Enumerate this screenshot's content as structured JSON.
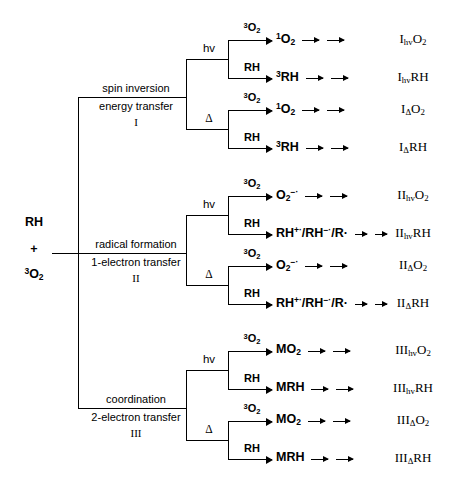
{
  "diagram": {
    "root": {
      "line1": "RH",
      "line2": "+",
      "line3_pre": "3",
      "line3_main": "O",
      "line3_sub": "2"
    },
    "conditions": {
      "photochemical": "hv",
      "thermal": "Δ"
    },
    "reagents": {
      "oxygen_pre": "3",
      "oxygen_main": "O",
      "oxygen_sub": "2",
      "substrate": "RH"
    },
    "branches": [
      {
        "id": "I",
        "name_line1": "spin inversion",
        "name_line2": "energy transfer",
        "numeral": "I",
        "rows": [
          {
            "condition": "hv",
            "reagent": "3O2",
            "species_html": "<sup class='pre'>1</sup>O<sub>2</sub>",
            "product_html": "I<sub>hv</sub>O<sub>2</sub>"
          },
          {
            "condition": "hv",
            "reagent": "RH",
            "species_html": "<sup class='pre'>3</sup>RH",
            "product_html": "I<sub>hv</sub>RH"
          },
          {
            "condition": "Δ",
            "reagent": "3O2",
            "species_html": "<sup class='pre'>1</sup>O<sub>2</sub>",
            "product_html": "I<sub>Δ</sub>O<sub>2</sub>"
          },
          {
            "condition": "Δ",
            "reagent": "RH",
            "species_html": "<sup class='pre'>3</sup>RH",
            "product_html": "I<sub>Δ</sub>RH"
          }
        ]
      },
      {
        "id": "II",
        "name_line1": "radical formation",
        "name_line2": "1-electron transfer",
        "numeral": "II",
        "rows": [
          {
            "condition": "hv",
            "reagent": "3O2",
            "species_html": "O<sub>2</sub><sup>−·</sup>",
            "product_html": "II<sub>hv</sub>O<sub>2</sub>"
          },
          {
            "condition": "hv",
            "reagent": "RH",
            "species_html": "RH<sup>+·</sup>/RH<sup>−·</sup>/R·",
            "product_html": "II<sub>hv</sub>RH"
          },
          {
            "condition": "Δ",
            "reagent": "3O2",
            "species_html": "O<sub>2</sub><sup>−·</sup>",
            "product_html": "II<sub>Δ</sub>O<sub>2</sub>"
          },
          {
            "condition": "Δ",
            "reagent": "RH",
            "species_html": "RH<sup>+·</sup>/RH<sup>−·</sup>/R·",
            "product_html": "II<sub>Δ</sub>RH"
          }
        ]
      },
      {
        "id": "III",
        "name_line1": "coordination",
        "name_line2": "2-electron transfer",
        "numeral": "III",
        "rows": [
          {
            "condition": "hv",
            "reagent": "3O2",
            "species_html": "MO<sub>2</sub>",
            "product_html": "III<sub>hv</sub>O<sub>2</sub>"
          },
          {
            "condition": "hv",
            "reagent": "RH",
            "species_html": "MRH",
            "product_html": "III<sub>hv</sub>RH"
          },
          {
            "condition": "Δ",
            "reagent": "3O2",
            "species_html": "MO<sub>2</sub>",
            "product_html": "III<sub>Δ</sub>O<sub>2</sub>"
          },
          {
            "condition": "Δ",
            "reagent": "RH",
            "species_html": "MRH",
            "product_html": "III<sub>Δ</sub>RH"
          }
        ]
      }
    ]
  }
}
